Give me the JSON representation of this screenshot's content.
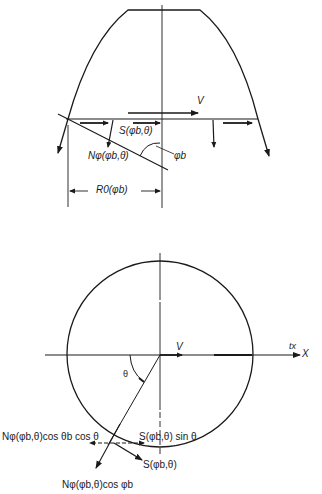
{
  "top_figure": {
    "velocity_label": "V",
    "shear_label": "S(φb,θ)",
    "normal_label": "Nφ(φb,θ)",
    "angle_label": "φb",
    "radius_label": "R0(φb)"
  },
  "bottom_figure": {
    "velocity_label": "V",
    "tx_label": "tx",
    "x_axis_label": "X",
    "theta_label": "θ",
    "normal_horizontal_label": "Nφ(φb,θ)cos θb cos θ",
    "shear_sin_label": "S(φb,θ) sin θ",
    "shear_label": "S(φb,θ)",
    "normal_cos_label": "Nφ(φb,θ)cos φb"
  },
  "colors": {
    "ink": "#1a1a1a",
    "background": "#ffffff"
  }
}
